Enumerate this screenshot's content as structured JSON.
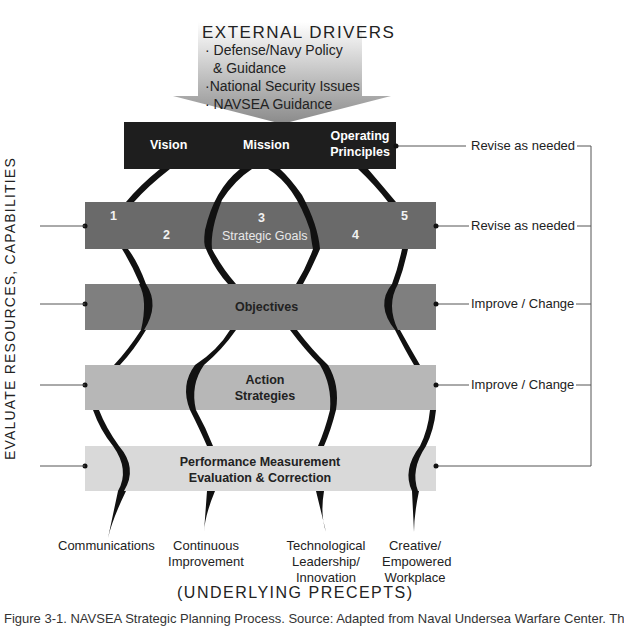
{
  "external_drivers": {
    "title": "EXTERNAL DRIVERS",
    "items": [
      "· Defense/Navy Policy",
      "& Guidance",
      "·National Security Issues",
      "· NAVSEA Guidance"
    ]
  },
  "bands": {
    "top": {
      "vision": "Vision",
      "mission": "Mission",
      "operating_1": "Operating",
      "operating_2": "Principles",
      "color": "#1e1e1e"
    },
    "goals": {
      "label": "Strategic Goals",
      "numbers": [
        "1",
        "2",
        "3",
        "4",
        "5"
      ],
      "color": "#6a6a6a"
    },
    "objectives": {
      "label": "Objectives",
      "color": "#7f7f7f"
    },
    "action": {
      "label_1": "Action",
      "label_2": "Strategies",
      "color": "#b5b5b5"
    },
    "performance": {
      "label_1": "Performance Measurement",
      "label_2": "Evaluation & Correction",
      "color": "#d9d9d9"
    }
  },
  "feedback": {
    "revise_1": "Revise as needed",
    "revise_2": "Revise as needed",
    "improve_1": "Improve / Change",
    "improve_2": "Improve / Change"
  },
  "left_label": "EVALUATE RESOURCES, CAPABILITIES",
  "precepts": {
    "communications": "Communications",
    "continuous_1": "Continuous",
    "continuous_2": "Improvement",
    "tech_1": "Technological",
    "tech_2": "Leadership/",
    "tech_3": "Innovation",
    "creative_1": "Creative/",
    "creative_2": "Empowered",
    "creative_3": "Workplace"
  },
  "underlying": "(UNDERLYING PRECEPTS)",
  "caption": "Figure 3-1. NAVSEA Strategic Planning Process. Source: Adapted from Naval Undersea Warfare Center. Th"
}
